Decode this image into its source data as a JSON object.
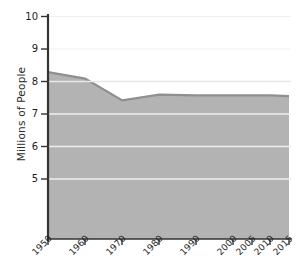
{
  "chart_data": {
    "type": "area",
    "title": "",
    "xlabel": "",
    "ylabel": "Millions of People",
    "x": [
      1950,
      1960,
      1970,
      1980,
      1990,
      2000,
      2005,
      2010,
      2015
    ],
    "categories": [
      "1950",
      "1960",
      "1970",
      "1980",
      "1990",
      "2000",
      "2005",
      "2010",
      "2015"
    ],
    "values": [
      8.4,
      8.2,
      7.52,
      7.7,
      7.68,
      7.68,
      7.68,
      7.68,
      7.65
    ],
    "series": [
      {
        "name": "Population",
        "values": [
          8.4,
          8.2,
          7.52,
          7.7,
          7.68,
          7.68,
          7.68,
          7.68,
          7.65
        ]
      }
    ],
    "ylim": [
      3.2,
      10.15
    ],
    "xlim": [
      1950,
      2015
    ],
    "yticks": [
      5,
      6,
      7,
      8,
      9,
      10
    ],
    "ytick_labels": [
      "5",
      "6",
      "7",
      "8",
      "9",
      "10"
    ],
    "xticks": [
      1950,
      1960,
      1970,
      1980,
      1990,
      2000,
      2005,
      2010,
      2015
    ],
    "xtick_labels": [
      "1950",
      "1960",
      "1970",
      "1980",
      "1990",
      "2000",
      "2005",
      "2010",
      "2015"
    ],
    "grid": true,
    "grid_color": "#f2f2f2",
    "legend": false,
    "legend_position": "none",
    "area_fill_color": "#b3b3b3",
    "area_line_color": "#8f8f8f",
    "axis_color": "#2f2f2f",
    "background_color": "#ffffff",
    "annotations": []
  },
  "axis": {
    "y_title": "Millions of People",
    "y_tick_10": "10",
    "y_tick_9": "9",
    "y_tick_8": "8",
    "y_tick_7": "7",
    "y_tick_6": "6",
    "y_tick_5": "5",
    "x_tick_1950": "1950",
    "x_tick_1960": "1960",
    "x_tick_1970": "1970",
    "x_tick_1980": "1980",
    "x_tick_1990": "1990",
    "x_tick_2000": "2000",
    "x_tick_2005": "2005",
    "x_tick_2010": "2010",
    "x_tick_2015": "2015"
  }
}
